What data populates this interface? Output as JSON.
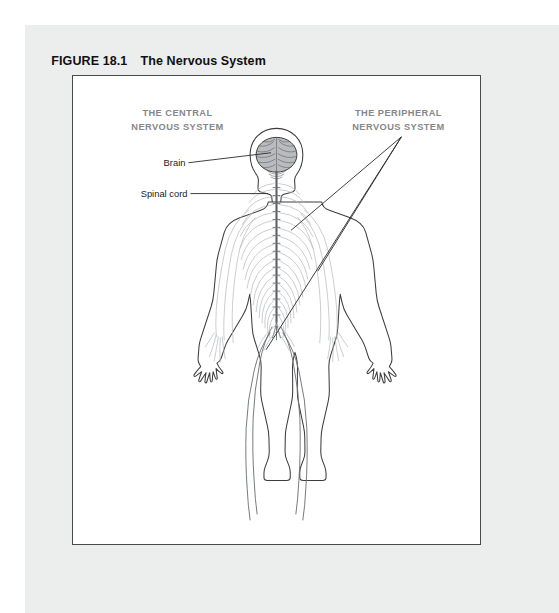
{
  "figure": {
    "number": "FIGURE 18.1",
    "title": "The Nervous System"
  },
  "diagram": {
    "type": "anatomical-illustration",
    "view": "posterior full-body",
    "captions": {
      "central": {
        "line1": "THE CENTRAL",
        "line2": "NERVOUS SYSTEM"
      },
      "peripheral": {
        "line1": "THE PERIPHERAL",
        "line2": "NERVOUS SYSTEM"
      }
    },
    "callouts": [
      {
        "label": "Brain",
        "target": "cerebrum inside skull"
      },
      {
        "label": "Spinal cord",
        "target": "vertebral canal"
      }
    ],
    "peripheral_targets": [
      "thoracic spinal nerves",
      "arm and hand nerves",
      "leg nerves"
    ],
    "colors": {
      "panel_background": "#eceded",
      "frame_background": "#ffffff",
      "frame_border": "#4a4a4a",
      "caption_text": "#85878a",
      "callout_text": "#1b1b1b",
      "body_outline": "#3d3d3d",
      "nerve_light": "#b6b9bd",
      "nerve_dark": "#6f7378",
      "spinal_cord": "#5c6065",
      "brain_fill": "#b9bbbe"
    }
  }
}
